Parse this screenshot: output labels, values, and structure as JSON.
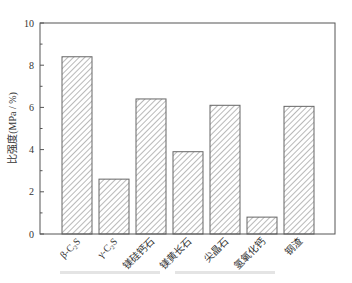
{
  "chart_data": {
    "type": "bar",
    "title": "",
    "xlabel": "",
    "ylabel": "比强度(MPa / %)",
    "ylim": [
      0,
      10
    ],
    "yticks": [
      0,
      2,
      4,
      6,
      8,
      10
    ],
    "grid": false,
    "legend": null,
    "bar_style": "diagonal-hatch",
    "categories": [
      "β-C₂S",
      "γ-C₂S",
      "镁硅钙石",
      "镁黄长石",
      "尖晶石",
      "氢氧化钙",
      "钢渣"
    ],
    "values": [
      8.4,
      2.6,
      6.4,
      3.9,
      6.1,
      0.8,
      6.05
    ]
  },
  "caption": "",
  "colors": {
    "axis": "#555555",
    "bar_edge": "#666666",
    "hatch": "#8a8a8a",
    "background": "#ffffff"
  }
}
